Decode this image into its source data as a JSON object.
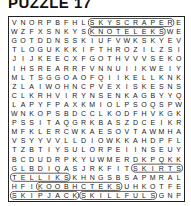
{
  "title": "PUZZLE 17",
  "grid": {
    "rows": 20,
    "cols": 20,
    "letters": [
      "VNORPBFHLSKYSCRAPERE",
      "WZFXSNKYSKNOTELEKSWE",
      "GOTDDNSSKIUFVWKSKYEV",
      "TLOGUKKKIFTHROZILZSI",
      "JIJKEECXFGOTHVVVSEKO",
      "IHSREARRFVNNUIIKWEIY",
      "MLTSGGOAOFQIIKELLKNK",
      "ZLAIWOHNCPVEXISKESNS",
      "CLKRHVIRYNSENKAGBYYQ",
      "LAPYFPAXKMIOLPSOQSPW",
      "WNKOPSBDCCLKODFHVKGK",
      "PSSITAQGRKBASZDCEIKR",
      "MFKLERCWKAESOVTAWMHA",
      "VSYYVVLLDIOWKKAHDPFL",
      "TZBTIYSULORPEIINSEUY",
      "BCDUDRPKYUWMERDKPQKK",
      "GLBDIQASJRKFITSKIRTS",
      "TELLIKSKHNGSBSAPMRAL",
      "HFIKOOBHCTEKSUHKOTFE",
      "SKIPJACKSKILLFULSGNP"
    ]
  },
  "found_words": [
    {
      "word": "SKYSCRAPER",
      "start": [
        0,
        9
      ],
      "end": [
        0,
        18
      ],
      "direction": "horizontal"
    },
    {
      "word": "KNOTELEKS",
      "start": [
        1,
        9
      ],
      "end": [
        1,
        17
      ],
      "direction": "horizontal"
    },
    {
      "word": "SKIRTS",
      "start": [
        16,
        14
      ],
      "end": [
        16,
        19
      ],
      "direction": "horizontal"
    },
    {
      "word": "SKILLETS",
      "start": [
        17,
        6
      ],
      "end": [
        17,
        0
      ],
      "direction": "horizontal-reverse"
    },
    {
      "word": "SKETCHBOOK",
      "start": [
        18,
        12
      ],
      "end": [
        18,
        3
      ],
      "direction": "horizontal-reverse"
    },
    {
      "word": "SKIPJACK",
      "start": [
        19,
        0
      ],
      "end": [
        19,
        7
      ],
      "direction": "horizontal"
    },
    {
      "word": "SKILLFULS",
      "start": [
        19,
        8
      ],
      "end": [
        19,
        16
      ],
      "direction": "horizontal"
    }
  ],
  "colors": {
    "background": "#ffffff",
    "text": "#222222",
    "circle_stroke": "#333333"
  }
}
